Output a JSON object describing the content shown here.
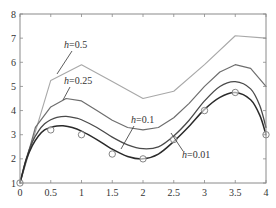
{
  "chart_data": {
    "type": "line",
    "title": "",
    "xlabel": "",
    "ylabel": "",
    "xlim": [
      0,
      4
    ],
    "ylim": [
      1,
      8
    ],
    "x_ticks": [
      0,
      0.5,
      1,
      1.5,
      2,
      2.5,
      3,
      3.5,
      4
    ],
    "x_tick_labels": [
      "0",
      "0.5",
      "1",
      "1.5",
      "2",
      "2.5",
      "3",
      "3.5",
      "4"
    ],
    "y_ticks": [
      1,
      2,
      3,
      4,
      5,
      6,
      7,
      8
    ],
    "y_tick_labels": [
      "1",
      "2",
      "3",
      "4",
      "5",
      "6",
      "7",
      "8"
    ],
    "grid": false,
    "legend": "none (inline annotations)",
    "series": [
      {
        "name": "h=0.5",
        "style": "polyline",
        "color": "#a8a8a8",
        "width": 1.1,
        "x": [
          0,
          0.5,
          1,
          1.5,
          2,
          2.5,
          3,
          3.5,
          4
        ],
        "y": [
          1,
          5.25,
          5.9,
          5.2,
          4.5,
          4.8,
          5.9,
          7.1,
          7.0
        ]
      },
      {
        "name": "h=0.25",
        "style": "polyline",
        "color": "#6e6e6e",
        "width": 1.2,
        "x": [
          0,
          0.25,
          0.5,
          0.75,
          1,
          1.25,
          1.5,
          1.75,
          2,
          2.25,
          2.5,
          2.75,
          3,
          3.25,
          3.5,
          3.75,
          4
        ],
        "y": [
          1,
          3.3,
          4.15,
          4.5,
          4.4,
          4.0,
          3.6,
          3.3,
          3.2,
          3.3,
          3.7,
          4.3,
          5.0,
          5.6,
          5.9,
          5.75,
          5.0
        ]
      },
      {
        "name": "h=0.1",
        "style": "smooth",
        "color": "#4a4a4a",
        "width": 1.3,
        "x": [
          0,
          0.1,
          0.2,
          0.3,
          0.4,
          0.5,
          0.6,
          0.75,
          0.9,
          1,
          1.25,
          1.5,
          1.75,
          2,
          2.25,
          2.5,
          2.75,
          3,
          3.25,
          3.5,
          3.75,
          3.9,
          4
        ],
        "y": [
          1,
          2.0,
          2.7,
          3.15,
          3.45,
          3.62,
          3.72,
          3.76,
          3.7,
          3.62,
          3.3,
          2.9,
          2.58,
          2.42,
          2.5,
          2.95,
          3.6,
          4.4,
          5.0,
          5.2,
          4.9,
          4.2,
          3.3
        ]
      },
      {
        "name": "h=0.01",
        "style": "smooth",
        "color": "#2a2a2a",
        "width": 1.5,
        "x": [
          0,
          0.1,
          0.2,
          0.3,
          0.4,
          0.5,
          0.6,
          0.7,
          0.85,
          1,
          1.25,
          1.5,
          1.75,
          2,
          2.25,
          2.5,
          2.75,
          3,
          3.25,
          3.5,
          3.75,
          3.9,
          4
        ],
        "y": [
          1,
          1.95,
          2.55,
          2.95,
          3.2,
          3.3,
          3.36,
          3.37,
          3.3,
          3.15,
          2.8,
          2.4,
          2.1,
          2.0,
          2.2,
          2.72,
          3.35,
          4.05,
          4.55,
          4.75,
          4.45,
          3.8,
          3.0
        ]
      }
    ],
    "exact_points": {
      "name": "exact solution (circles)",
      "marker": "open-circle",
      "color": "#777777",
      "x": [
        0,
        0.5,
        1,
        1.5,
        2,
        2.5,
        3,
        3.5,
        4
      ],
      "y": [
        1,
        3.2,
        3.0,
        2.2,
        2.0,
        2.8,
        4.0,
        4.75,
        3.0
      ]
    },
    "annotations": [
      {
        "text": "h=0.5",
        "label_xy": [
          64,
          48
        ],
        "leader_from": [
          72,
          51
        ],
        "leader_to": [
          57,
          74
        ]
      },
      {
        "text": "h=0.25",
        "label_xy": [
          64,
          84
        ],
        "leader_from": [
          70,
          87
        ],
        "leader_to": [
          63,
          100
        ]
      },
      {
        "text": "h=0.1",
        "label_xy": [
          131,
          123
        ],
        "leader_from": [
          134,
          126
        ],
        "leader_to": [
          121,
          149
        ]
      },
      {
        "text": "h=0.01",
        "label_xy": [
          182,
          158
        ],
        "leader_from": [
          183,
          151
        ],
        "leader_to": [
          171,
          133
        ]
      }
    ]
  },
  "plot_area": {
    "left_px": 20,
    "right_px": 266,
    "top_px": 14,
    "bottom_px": 183,
    "axis_color": "#8a8a8a"
  }
}
